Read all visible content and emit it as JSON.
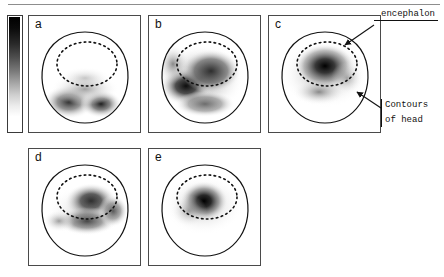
{
  "figure": {
    "kind": "topographic-map-grid",
    "modality": "grayscale electrical/neural activity distribution maps of the head",
    "panel_count": 5,
    "rows": 2,
    "columns_row1": 3,
    "columns_row2": 2
  },
  "colorbar": {
    "name": "grayscale-intensity-colorbar",
    "orientation": "vertical",
    "top_color": "#000000",
    "bottom_color": "#ffffff",
    "ticks": [],
    "tick_labels": [],
    "title": ""
  },
  "panels": [
    {
      "id": "a",
      "label": "a",
      "row": 1,
      "col": 1,
      "description": "Activity concentrated in the lower (posterior) region of the head, two dark lobes below the encephalon contour; interior of encephalon mostly white."
    },
    {
      "id": "b",
      "label": "b",
      "row": 1,
      "col": 2,
      "description": "Broad diffuse dark activity covering most of the head with the darkest band on the left-central area."
    },
    {
      "id": "c",
      "label": "c",
      "row": 1,
      "col": 3,
      "description": "Dark activity centred inside the encephalon contour, fading smoothly toward the head border."
    },
    {
      "id": "d",
      "label": "d",
      "row": 2,
      "col": 1,
      "description": "Dark activity in the central and upper-right area of the head, extending below the encephalon contour."
    },
    {
      "id": "e",
      "label": "e",
      "row": 2,
      "col": 2,
      "description": "Compact dark focus in the centre of the encephalon, radially fading outward."
    }
  ],
  "annotations": [
    {
      "name": "encephalon-annotation",
      "text": "encephalon",
      "points_to": "inner dotted contour of panel c",
      "arrow": true
    },
    {
      "name": "contours-of-head-annotation",
      "line1": "Contours",
      "line2": "of head",
      "points_to": "outer solid contour of panel c",
      "arrow": true
    }
  ],
  "colors": {
    "panel_border": "#4a4a4a",
    "contour_line": "#111111",
    "text": "#111111",
    "rule": "#8d8d8d",
    "background": "#ffffff"
  }
}
